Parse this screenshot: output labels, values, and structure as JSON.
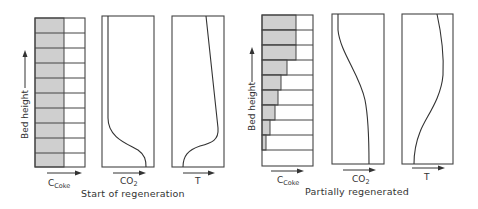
{
  "figure": {
    "panels": [
      {
        "caption": "Start of regeneration",
        "y_axis_label": "Bed height",
        "coke": {
          "label_main": "C",
          "label_sub": "Coke",
          "rows": 10,
          "shade_fraction_by_row_top_to_bottom": [
            0.58,
            0.58,
            0.58,
            0.58,
            0.58,
            0.58,
            0.58,
            0.58,
            0.58,
            0.58
          ]
        },
        "co2": {
          "label_main": "CO",
          "label_sub": "2",
          "profile": "flat near zero, rising sharply near bed bottom"
        },
        "temperature": {
          "label": "T",
          "profile": "high, slightly increasing downward, dropping sharply near bed bottom"
        }
      },
      {
        "caption": "Partially regenerated",
        "y_axis_label": "Bed height",
        "coke": {
          "label_main": "C",
          "label_sub": "Coke",
          "rows": 10,
          "shade_fraction_by_row_top_to_bottom": [
            0.67,
            0.67,
            0.67,
            0.47,
            0.37,
            0.31,
            0.25,
            0.16,
            0.08,
            0.0
          ]
        },
        "co2": {
          "label_main": "CO",
          "label_sub": "2",
          "profile": "low at top, S-curve increasing toward lower bed"
        },
        "temperature": {
          "label": "T",
          "profile": "high at top, S-curve decreasing toward lower bed"
        }
      }
    ]
  },
  "colors": {
    "line": "#333333",
    "coke_shade": "#cfcfcf",
    "background": "#ffffff"
  }
}
